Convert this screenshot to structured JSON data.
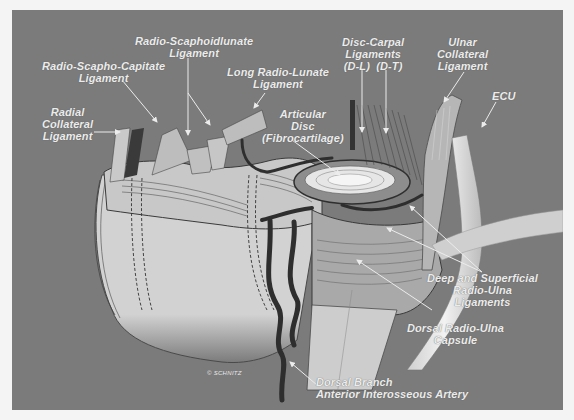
{
  "figure": {
    "background_color": "#7b7b7b",
    "label_color": "#ececec",
    "artery_color": "#2e2e2e",
    "credit": "© SCHNITZ"
  },
  "labels": {
    "radial_collateral": [
      "Radial",
      "Collateral",
      "Ligament"
    ],
    "radio_scapho_capitate": [
      "Radio-Scapho-Capitate",
      "Ligament"
    ],
    "radio_scaphoidlunate": [
      "Radio-Scaphoidlunate",
      "Ligament"
    ],
    "long_radio_lunate": [
      "Long Radio-Lunate",
      "Ligament"
    ],
    "articular_disc": [
      "Articular",
      "Disc",
      "(Fibrocartilage)"
    ],
    "disc_carpal": [
      "Disc-Carpal",
      "Ligaments",
      "(D-L)  (D-T)"
    ],
    "ulnar_collateral": [
      "Ulnar",
      "Collateral",
      "Ligament"
    ],
    "ecu": [
      "ECU"
    ],
    "deep_superficial_radio_ulna": [
      "Deep and Superficial",
      "Radio-Ulna",
      "Ligaments"
    ],
    "dorsal_radio_ulna_capsule": [
      "Dorsal Radio-Ulna",
      "Capsule"
    ],
    "dorsal_branch_artery": [
      "Dorsal Branch",
      "Anterior Interosseous Artery"
    ]
  }
}
